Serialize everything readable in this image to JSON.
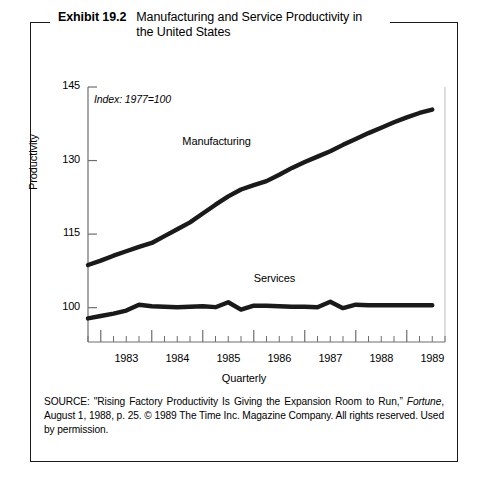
{
  "exhibit": {
    "number": "Exhibit 19.2",
    "title": "Manufacturing and Service Productivity in the United States"
  },
  "source_note": {
    "prefix": "SOURCE: \"Rising Factory Productivity Is Giving the Expansion Room to Run,” ",
    "italic": "Fortune",
    "suffix": ", August 1, 1988, p. 25. © 1989 The Time Inc. Magazine Company. All rights reserved. Used by permission."
  },
  "chart_data": {
    "type": "line",
    "title": "Manufacturing and Service Productivity in the United States",
    "annotation": "Index: 1977=100",
    "xlabel": "Quarterly",
    "ylabel": "Productivity",
    "ylim": [
      93,
      145
    ],
    "yticks": [
      100,
      115,
      130,
      145
    ],
    "ytick_labels": [
      "100",
      "115",
      "130",
      "145"
    ],
    "xlim": [
      1982.75,
      1989.75
    ],
    "xticks": [
      1983,
      1984,
      1985,
      1986,
      1987,
      1988,
      1989
    ],
    "xtick_labels": [
      "1983",
      "1984",
      "1985",
      "1986",
      "1987",
      "1988",
      "1989"
    ],
    "minor_ticks_per_year": 4,
    "grid": false,
    "legend": "inline-labels",
    "line_color": "#1a1a1a",
    "x": [
      1982.75,
      1983.0,
      1983.25,
      1983.5,
      1983.75,
      1984.0,
      1984.25,
      1984.5,
      1984.75,
      1985.0,
      1985.25,
      1985.5,
      1985.75,
      1986.0,
      1986.25,
      1986.5,
      1986.75,
      1987.0,
      1987.25,
      1987.5,
      1987.75,
      1988.0,
      1988.25,
      1988.5,
      1988.75,
      1989.0,
      1989.25,
      1989.5
    ],
    "series": [
      {
        "name": "Manufacturing",
        "label_position": {
          "x": 1984.6,
          "y": 133.5
        },
        "values": [
          108.7,
          109.6,
          110.6,
          111.5,
          112.4,
          113.2,
          114.6,
          116.0,
          117.4,
          119.2,
          121.0,
          122.7,
          124.1,
          125.0,
          125.8,
          127.1,
          128.5,
          129.7,
          130.8,
          131.9,
          133.2,
          134.4,
          135.6,
          136.7,
          137.8,
          138.8,
          139.7,
          140.4
        ]
      },
      {
        "name": "Services",
        "label_position": {
          "x": 1986.0,
          "y": 105.6
        },
        "values": [
          97.8,
          98.3,
          98.8,
          99.4,
          100.6,
          100.3,
          100.2,
          100.1,
          100.2,
          100.3,
          100.1,
          101.1,
          99.6,
          100.4,
          100.4,
          100.3,
          100.2,
          100.2,
          100.1,
          101.2,
          99.9,
          100.6,
          100.5,
          100.5,
          100.5,
          100.5,
          100.5,
          100.5
        ]
      }
    ]
  }
}
